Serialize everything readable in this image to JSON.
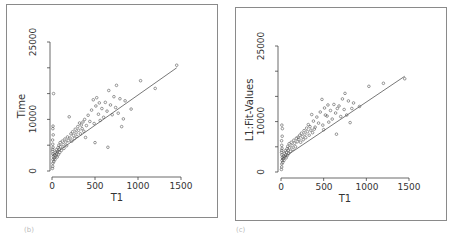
{
  "chart_data": [
    {
      "type": "scatter",
      "title": "",
      "xlabel": "T1",
      "ylabel": "Time",
      "xlim": [
        0,
        1500
      ],
      "ylim": [
        0,
        25000
      ],
      "xticks": [
        0,
        500,
        1000,
        1500
      ],
      "yticks": [
        0,
        5000,
        10000,
        15000,
        20000,
        25000
      ],
      "ytick_labels": [
        "0",
        "",
        "10000",
        "",
        "",
        "25000"
      ],
      "grid": false,
      "fit_line": {
        "x": [
          0,
          1450
        ],
        "y": [
          3000,
          20000
        ]
      },
      "points": [
        [
          5,
          500
        ],
        [
          8,
          900
        ],
        [
          10,
          1500
        ],
        [
          12,
          2200
        ],
        [
          15,
          2800
        ],
        [
          10,
          3300
        ],
        [
          6,
          3800
        ],
        [
          8,
          4200
        ],
        [
          12,
          4600
        ],
        [
          9,
          5200
        ],
        [
          7,
          6000
        ],
        [
          14,
          7000
        ],
        [
          10,
          8200
        ],
        [
          12,
          8700
        ],
        [
          18,
          15000
        ],
        [
          20,
          1800
        ],
        [
          25,
          2500
        ],
        [
          30,
          3000
        ],
        [
          35,
          2200
        ],
        [
          40,
          3600
        ],
        [
          45,
          2900
        ],
        [
          50,
          4100
        ],
        [
          55,
          3300
        ],
        [
          60,
          2700
        ],
        [
          65,
          3800
        ],
        [
          70,
          4500
        ],
        [
          75,
          3200
        ],
        [
          80,
          5000
        ],
        [
          85,
          4200
        ],
        [
          90,
          3600
        ],
        [
          95,
          5500
        ],
        [
          100,
          4700
        ],
        [
          110,
          4000
        ],
        [
          120,
          5800
        ],
        [
          130,
          5100
        ],
        [
          140,
          4400
        ],
        [
          150,
          6200
        ],
        [
          160,
          5600
        ],
        [
          170,
          4900
        ],
        [
          180,
          6600
        ],
        [
          190,
          5900
        ],
        [
          200,
          10500
        ],
        [
          210,
          6400
        ],
        [
          220,
          7200
        ],
        [
          230,
          5800
        ],
        [
          240,
          7600
        ],
        [
          250,
          6900
        ],
        [
          260,
          6300
        ],
        [
          270,
          8100
        ],
        [
          280,
          7400
        ],
        [
          290,
          6700
        ],
        [
          300,
          8600
        ],
        [
          310,
          7900
        ],
        [
          320,
          9300
        ],
        [
          330,
          7200
        ],
        [
          340,
          8900
        ],
        [
          350,
          8200
        ],
        [
          360,
          9500
        ],
        [
          370,
          7700
        ],
        [
          380,
          10000
        ],
        [
          390,
          6500
        ],
        [
          400,
          8800
        ],
        [
          420,
          10800
        ],
        [
          440,
          9600
        ],
        [
          460,
          11800
        ],
        [
          480,
          13800
        ],
        [
          490,
          9200
        ],
        [
          500,
          5500
        ],
        [
          510,
          12600
        ],
        [
          520,
          14200
        ],
        [
          540,
          11000
        ],
        [
          550,
          13200
        ],
        [
          560,
          9800
        ],
        [
          580,
          12100
        ],
        [
          600,
          10400
        ],
        [
          620,
          13300
        ],
        [
          640,
          11600
        ],
        [
          650,
          4600
        ],
        [
          660,
          15600
        ],
        [
          680,
          12800
        ],
        [
          700,
          10900
        ],
        [
          720,
          14400
        ],
        [
          740,
          12300
        ],
        [
          750,
          16600
        ],
        [
          770,
          11200
        ],
        [
          790,
          14000
        ],
        [
          810,
          8600
        ],
        [
          830,
          10100
        ],
        [
          850,
          13600
        ],
        [
          920,
          12000
        ],
        [
          1030,
          17500
        ],
        [
          1200,
          16000
        ],
        [
          1450,
          20500
        ]
      ]
    },
    {
      "type": "scatter",
      "title": "",
      "xlabel": "T1",
      "ylabel": "L1:Fit-Values",
      "xlim": [
        0,
        1500
      ],
      "ylim": [
        0,
        25000
      ],
      "xticks": [
        0,
        500,
        1000,
        1500
      ],
      "yticks": [
        0,
        5000,
        10000,
        15000,
        20000,
        25000
      ],
      "ytick_labels": [
        "0",
        "",
        "10000",
        "",
        "",
        "25000"
      ],
      "grid": false,
      "fit_line": {
        "x": [
          0,
          1450
        ],
        "y": [
          2500,
          19000
        ]
      },
      "points": [
        [
          5,
          500
        ],
        [
          8,
          1000
        ],
        [
          10,
          1600
        ],
        [
          12,
          2300
        ],
        [
          15,
          2900
        ],
        [
          10,
          3400
        ],
        [
          6,
          3900
        ],
        [
          8,
          4300
        ],
        [
          12,
          4700
        ],
        [
          9,
          5300
        ],
        [
          7,
          6200
        ],
        [
          14,
          7100
        ],
        [
          10,
          9300
        ],
        [
          16,
          8600
        ],
        [
          20,
          1900
        ],
        [
          25,
          2600
        ],
        [
          30,
          3100
        ],
        [
          35,
          2300
        ],
        [
          40,
          3700
        ],
        [
          45,
          3000
        ],
        [
          50,
          4200
        ],
        [
          55,
          3400
        ],
        [
          60,
          2800
        ],
        [
          65,
          3900
        ],
        [
          70,
          4600
        ],
        [
          75,
          3300
        ],
        [
          80,
          5100
        ],
        [
          85,
          4300
        ],
        [
          90,
          3700
        ],
        [
          95,
          5600
        ],
        [
          100,
          4800
        ],
        [
          110,
          4100
        ],
        [
          120,
          5900
        ],
        [
          130,
          5200
        ],
        [
          140,
          4500
        ],
        [
          150,
          6300
        ],
        [
          160,
          5700
        ],
        [
          170,
          5000
        ],
        [
          180,
          6700
        ],
        [
          190,
          6000
        ],
        [
          200,
          6900
        ],
        [
          210,
          6500
        ],
        [
          220,
          7300
        ],
        [
          230,
          5900
        ],
        [
          240,
          7700
        ],
        [
          250,
          7000
        ],
        [
          260,
          6400
        ],
        [
          270,
          8200
        ],
        [
          280,
          7500
        ],
        [
          290,
          6800
        ],
        [
          300,
          8700
        ],
        [
          310,
          8000
        ],
        [
          320,
          9400
        ],
        [
          330,
          7300
        ],
        [
          340,
          9000
        ],
        [
          350,
          8300
        ],
        [
          360,
          11400
        ],
        [
          370,
          7800
        ],
        [
          380,
          10100
        ],
        [
          390,
          8500
        ],
        [
          400,
          8900
        ],
        [
          420,
          10900
        ],
        [
          440,
          9700
        ],
        [
          460,
          11900
        ],
        [
          480,
          14400
        ],
        [
          490,
          9300
        ],
        [
          500,
          8400
        ],
        [
          510,
          12700
        ],
        [
          520,
          11300
        ],
        [
          540,
          11100
        ],
        [
          550,
          13300
        ],
        [
          560,
          9900
        ],
        [
          580,
          12200
        ],
        [
          600,
          10500
        ],
        [
          620,
          13400
        ],
        [
          640,
          11700
        ],
        [
          650,
          7500
        ],
        [
          660,
          12600
        ],
        [
          680,
          13100
        ],
        [
          700,
          11000
        ],
        [
          720,
          14500
        ],
        [
          740,
          12400
        ],
        [
          750,
          15600
        ],
        [
          770,
          11300
        ],
        [
          790,
          14100
        ],
        [
          810,
          9800
        ],
        [
          830,
          12600
        ],
        [
          850,
          13700
        ],
        [
          920,
          13000
        ],
        [
          1030,
          17000
        ],
        [
          1200,
          17600
        ],
        [
          1450,
          18500
        ]
      ]
    }
  ],
  "panels": [
    {
      "y_tick_labels": {
        "top": "25000",
        "mid": "10000",
        "bottom": "0"
      },
      "x_tick_labels": [
        "0",
        "500",
        "1000",
        "1500"
      ],
      "xlabel": "T1",
      "ylabel": "Time"
    },
    {
      "y_tick_labels": {
        "top": "25000",
        "mid": "10000",
        "bottom": "0"
      },
      "x_tick_labels": [
        "0",
        "500",
        "1000",
        "1500"
      ],
      "xlabel": "T1",
      "ylabel": "L1:Fit-Values"
    }
  ],
  "footer": {
    "left_mark": "(b)",
    "right_mark": "(c)"
  },
  "colors": {
    "frame": "#8a8a8a",
    "axis": "#444444",
    "points": "#555555",
    "line": "#555555"
  }
}
